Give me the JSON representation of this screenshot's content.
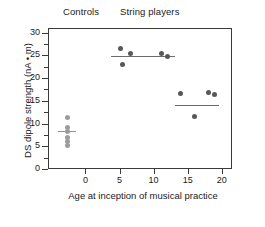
{
  "chart_data": {
    "type": "scatter",
    "title": "",
    "xlabel": "Age at inception of musical practice",
    "ylabel": "DS dipole strength (nA • m)",
    "xlim": [
      -5.5,
      21.5
    ],
    "ylim": [
      0,
      31
    ],
    "grid": false,
    "legend": "none",
    "xticks": [
      0,
      5,
      10,
      15,
      20
    ],
    "xtick_labels": [
      "0",
      "5",
      "10",
      "15",
      "20"
    ],
    "yticks": [
      0,
      5,
      10,
      15,
      20,
      25,
      30
    ],
    "ytick_labels": [
      "0",
      "5",
      "10",
      "15",
      "20",
      "25",
      "30"
    ],
    "ytick_minor": [
      2.5,
      7.5,
      12.5,
      17.5,
      22.5,
      27.5
    ],
    "group_labels": {
      "controls": "Controls",
      "string_players": "String players"
    },
    "series": [
      {
        "name": "Controls",
        "color": "#9c9c9c",
        "points": [
          {
            "x": -2.7,
            "y": 11.4
          },
          {
            "x": -2.7,
            "y": 9.1
          },
          {
            "x": -2.7,
            "y": 8.3
          },
          {
            "x": -2.7,
            "y": 7.0
          },
          {
            "x": -2.7,
            "y": 6.0
          },
          {
            "x": -2.7,
            "y": 5.1
          }
        ],
        "mean": 8.2,
        "mean_line": {
          "x_start": -4.0,
          "x_end": -1.4,
          "y": 8.2,
          "color": "#8f8f8f"
        }
      },
      {
        "name": "String players (early start)",
        "color": "#575757",
        "points": [
          {
            "x": 5.1,
            "y": 26.6
          },
          {
            "x": 5.5,
            "y": 22.9
          },
          {
            "x": 6.6,
            "y": 25.5
          },
          {
            "x": 11.1,
            "y": 25.3
          },
          {
            "x": 12.0,
            "y": 24.7
          }
        ],
        "mean": 24.7,
        "mean_line": {
          "x_start": 3.8,
          "x_end": 13.1,
          "y": 24.7,
          "color": "#6b6b6b"
        }
      },
      {
        "name": "String players (late start)",
        "color": "#575757",
        "points": [
          {
            "x": 14.0,
            "y": 16.5
          },
          {
            "x": 16.0,
            "y": 11.5
          },
          {
            "x": 18.0,
            "y": 16.8
          },
          {
            "x": 19.0,
            "y": 16.3
          }
        ],
        "mean": 14.0,
        "mean_line": {
          "x_start": 13.2,
          "x_end": 19.6,
          "y": 14.0,
          "color": "#6b6b6b"
        }
      }
    ]
  }
}
